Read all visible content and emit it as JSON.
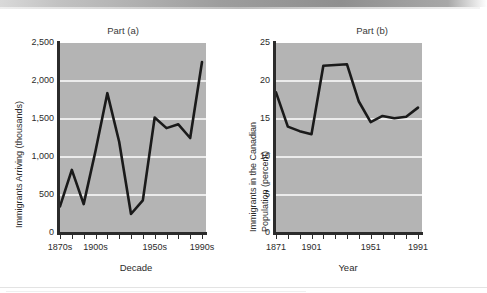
{
  "chart_data": [
    {
      "type": "line",
      "title": "Part (a)",
      "xlabel": "Decade",
      "ylabel": "Immigrants Arriving (thousands)",
      "ylim": [
        0,
        2500
      ],
      "yticks": [
        0,
        500,
        1000,
        1500,
        2000,
        2500
      ],
      "ytick_labels": [
        "0",
        "500",
        "1,000",
        "1,500",
        "2,000",
        "2,500"
      ],
      "grid": true,
      "grid_color": "#ffffff",
      "plot_bg": "#b4b4b4",
      "line_color": "#1a1a1a",
      "legend": null,
      "xtick_count": 13,
      "xtick_labels_shown": [
        "1870s",
        "1900s",
        "1950s",
        "1990s"
      ],
      "xtick_label_indices": [
        0,
        3,
        8,
        12
      ],
      "categories": [
        "1870s",
        "1880s",
        "1890s",
        "1900s",
        "1910s",
        "1920s",
        "1930s",
        "1940s",
        "1950s",
        "1960s",
        "1970s",
        "1980s",
        "1990s"
      ],
      "values": [
        350,
        830,
        380,
        1080,
        1840,
        1200,
        250,
        430,
        1520,
        1380,
        1430,
        1250,
        2250
      ]
    },
    {
      "type": "line",
      "title": "Part (b)",
      "xlabel": "Year",
      "ylabel": "Immigrants in the Canadian Population (percent)",
      "ylabel_line1": "Immigrants in the Canadian",
      "ylabel_line2": "Population (percent)",
      "ylim": [
        0,
        25
      ],
      "yticks": [
        0,
        5,
        10,
        15,
        20,
        25
      ],
      "ytick_labels": [
        "0",
        "5",
        "10",
        "15",
        "20",
        "25"
      ],
      "grid": true,
      "grid_color": "#ffffff",
      "plot_bg": "#b4b4b4",
      "line_color": "#1a1a1a",
      "legend": null,
      "xtick_count": 13,
      "xtick_labels_shown": [
        "1871",
        "1901",
        "1951",
        "1991"
      ],
      "xtick_label_indices": [
        0,
        3,
        8,
        12
      ],
      "categories": [
        "1871",
        "1881",
        "1891",
        "1901",
        "1911",
        "1921",
        "1931",
        "1941",
        "1951",
        "1961",
        "1971",
        "1981",
        "1991"
      ],
      "values": [
        18.5,
        14.0,
        13.4,
        13.0,
        22.0,
        22.1,
        22.2,
        17.3,
        14.6,
        15.4,
        15.1,
        15.3,
        16.5
      ]
    }
  ]
}
